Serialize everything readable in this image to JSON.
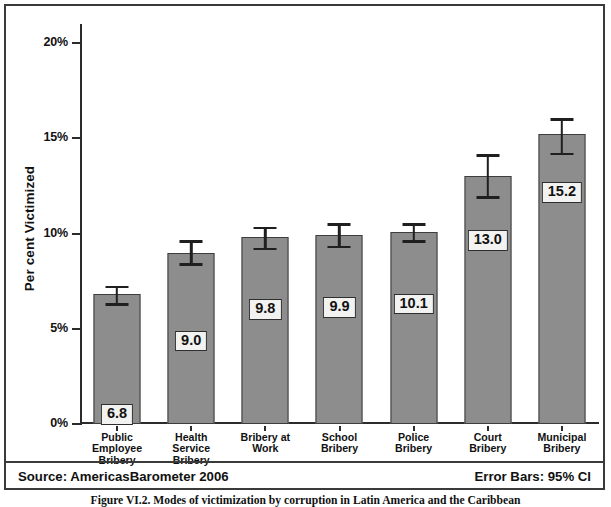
{
  "figure": {
    "caption": "Figure VI.2.  Modes of victimization by corruption in Latin America and the Caribbean",
    "source_label": "Source: AmericasBarometer  2006",
    "errorbar_label": "Error Bars: 95% CI"
  },
  "chart_data": {
    "type": "bar",
    "title": "",
    "xlabel": "",
    "ylabel": "Per cent Victimized",
    "ylim": [
      0,
      21
    ],
    "grid": false,
    "legend": null,
    "ytick_labels": [
      "0%",
      "5%",
      "10%",
      "15%",
      "20%"
    ],
    "ytick_values": [
      0,
      5,
      10,
      15,
      20
    ],
    "categories": [
      "Public Employee Bribery",
      "Health Service Bribery",
      "Bribery at Work",
      "School Bribery",
      "Police Bribery",
      "Court Bribery",
      "Municipal Bribery"
    ],
    "category_lines": [
      [
        "Public",
        "Employee",
        "Bribery"
      ],
      [
        "Health",
        "Service",
        "Bribery"
      ],
      [
        "Bribery at",
        "Work"
      ],
      [
        "School",
        "Bribery"
      ],
      [
        "Police",
        "Bribery"
      ],
      [
        "Court",
        "Bribery"
      ],
      [
        "Municipal",
        "Bribery"
      ]
    ],
    "values": [
      6.8,
      9.0,
      9.8,
      9.9,
      10.1,
      13.0,
      15.2
    ],
    "value_labels": [
      "6.8",
      "9.0",
      "9.8",
      "9.9",
      "10.1",
      "13.0",
      "15.2"
    ],
    "error_ci_low": [
      6.3,
      8.4,
      9.2,
      9.3,
      9.6,
      11.9,
      14.2
    ],
    "error_ci_high": [
      7.2,
      9.6,
      10.3,
      10.5,
      10.5,
      14.1,
      16.0
    ],
    "errorbar_type": "95% CI",
    "bar_color": "#8d8d8d",
    "bar_border_color": "#3d3d3d",
    "axis_color": "#2b2b2b",
    "label_box_fill": "#f2f2f0"
  }
}
